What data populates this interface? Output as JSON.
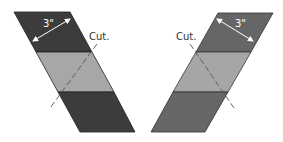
{
  "diagram": {
    "left_strip": {
      "dimension_label": "3\"",
      "cut_label": "Cut.",
      "colors": {
        "outer": "#3c3c3c",
        "middle": "#a7a7a7",
        "edge": "#222222"
      },
      "cut_direction": "lower-left"
    },
    "right_strip": {
      "dimension_label": "3\"",
      "cut_label": "Cut.",
      "colors": {
        "outer": "#666666",
        "middle": "#a6a6a6",
        "edge": "#333333"
      },
      "cut_direction": "lower-right"
    },
    "cut_line_color": "#555555",
    "dimension_arrow_color": "#ffffff"
  }
}
